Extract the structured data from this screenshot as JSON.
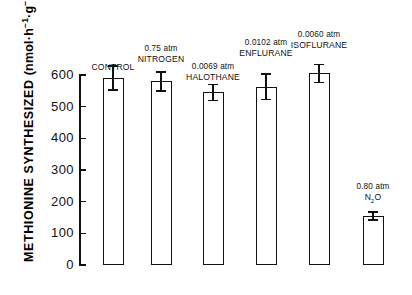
{
  "chart_data": {
    "type": "bar",
    "title": "",
    "subtitle": "",
    "xlabel": "",
    "ylabel": "METHIONINE SYNTHESIZED (nmol·h⁻¹·g⁻¹)",
    "ylabel_text": "METHIONINE SYNTHESIZED",
    "ylabel_units": "(nmol·h⁻¹·g⁻¹)",
    "ylim": [
      0,
      620
    ],
    "yticks": [
      0,
      100,
      200,
      300,
      400,
      500,
      600
    ],
    "ytick_labels": [
      "0",
      "100",
      "200",
      "300",
      "400",
      "500",
      "600"
    ],
    "grid": false,
    "legend": "none",
    "error_type": "SEM",
    "categories": [
      "CONTROL",
      "0.75 atm NITROGEN",
      "0.0069 atm HALOTHANE",
      "0.0102 atm ENFLURANE",
      "0.0060 atm ISOFLURANE",
      "0.80 atm N2O"
    ],
    "values": [
      590,
      580,
      545,
      563,
      605,
      155
    ],
    "errors": [
      38,
      30,
      25,
      40,
      28,
      13
    ],
    "bars": [
      {
        "id": "control",
        "dose": "",
        "agent": "CONTROL",
        "label_lines": [
          "CONTROL"
        ],
        "value": 590,
        "error": 38
      },
      {
        "id": "nitrogen",
        "dose": "0.75 atm",
        "agent": "NITROGEN",
        "label_lines": [
          "0.75 atm",
          "NITROGEN"
        ],
        "value": 580,
        "error": 30
      },
      {
        "id": "halothane",
        "dose": "0.0069 atm",
        "agent": "HALOTHANE",
        "label_lines": [
          "0.0069 atm",
          "HALOTHANE"
        ],
        "value": 545,
        "error": 25
      },
      {
        "id": "enflurane",
        "dose": "0.0102 atm",
        "agent": "ENFLURANE",
        "label_lines": [
          "0.0102 atm",
          "ENFLURANE"
        ],
        "value": 563,
        "error": 40
      },
      {
        "id": "isoflurane",
        "dose": "0.0060 atm",
        "agent": "ISOFLURANE",
        "label_lines": [
          "0.0060 atm",
          "ISOFLURANE"
        ],
        "value": 605,
        "error": 28
      },
      {
        "id": "nitrous-oxide",
        "dose": "0.80 atm",
        "agent": "N2O",
        "agent_html_base": "N",
        "agent_html_sub": "2",
        "agent_html_tail": "O",
        "label_lines": [
          "0.80 atm",
          "N2O"
        ],
        "value": 155,
        "error": 13
      }
    ],
    "colors": {
      "bar_fill": "#ffffff",
      "bar_stroke": "#111111",
      "axis": "#111111",
      "text": "#111111",
      "background": "#ffffff"
    }
  }
}
